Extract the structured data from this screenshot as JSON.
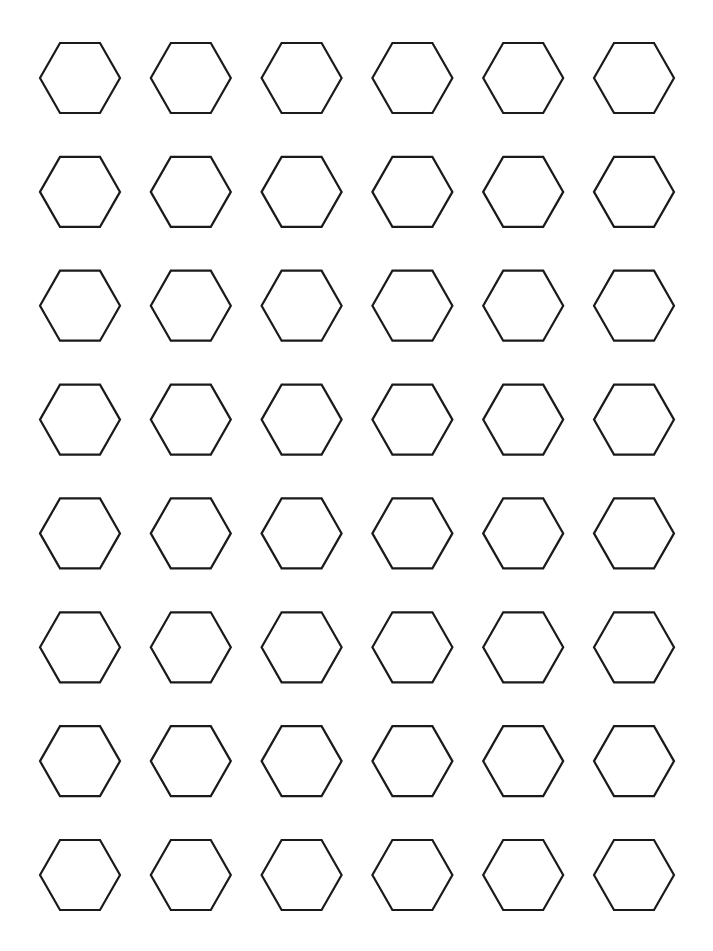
{
  "page": {
    "background": "#ffffff"
  },
  "grid": {
    "rows": 8,
    "columns": 6,
    "shape": "hexagon",
    "orientation": "flat-top",
    "stroke_color": "#1a1a1a",
    "stroke_width": 2.2,
    "hex_width": 80,
    "hex_height": 70,
    "column_centers": [
      80,
      190.8,
      301.6,
      412.4,
      523.2,
      634
    ],
    "row_centers": [
      78,
      191.9,
      305.7,
      419.6,
      533.4,
      647.3,
      761.1,
      875
    ]
  }
}
